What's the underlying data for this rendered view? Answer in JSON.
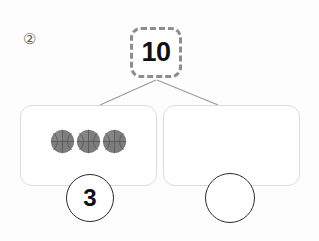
{
  "worksheet": {
    "problem_index": "②",
    "total": {
      "value": "10",
      "style": "dashed-box"
    },
    "parts": [
      {
        "position": "left",
        "object_icon": "basketball-icon",
        "object_count": 3,
        "answer": "3",
        "answer_filled": true
      },
      {
        "position": "right",
        "object_icon": "basketball-icon",
        "object_count": 0,
        "answer": "",
        "answer_filled": false
      }
    ],
    "colors": {
      "background": "#fdfdfd",
      "total_border": "#8d8d8d",
      "part_border": "#dcdcdc",
      "connector_line": "#9a9a9a",
      "answer_circle_border": "#2b2b2b",
      "text": "#111111",
      "index_text": "#5f5f5f",
      "ball_fill": "#7d7d7d",
      "ball_highlight": "#9a9a9a",
      "ball_seam": "#5a5a5a"
    }
  }
}
